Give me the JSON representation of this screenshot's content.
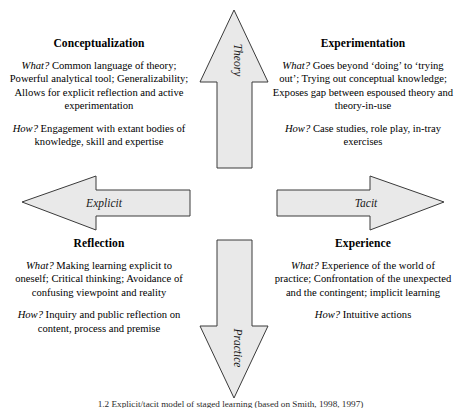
{
  "figure": {
    "caption": "1.2   Explicit/tacit model of staged learning (based on Smith, 1998, 1997)"
  },
  "axes": {
    "vertical_top": "Theory",
    "vertical_bottom": "Practice",
    "horizontal_left": "Explicit",
    "horizontal_right": "Tacit"
  },
  "labels": {
    "what": "What?",
    "how": "How?"
  },
  "quadrants": [
    {
      "id": "conceptualization",
      "title": "Conceptualization",
      "what": "Common language of theory; Powerful analytical tool; Generalizability; Allows for explicit reflection and active experimentation",
      "how": "Engagement with extant bodies of knowledge, skill and expertise"
    },
    {
      "id": "experimentation",
      "title": "Experimentation",
      "what": "Goes beyond ‘doing’ to ‘trying out’; Trying out conceptual knowledge; Exposes gap between espoused theory and theory-in-use",
      "how": "Case studies, role play, in-tray exercises"
    },
    {
      "id": "reflection",
      "title": "Reflection",
      "what": "Making learning explicit to oneself; Critical thinking; Avoidance of confusing viewpoint and reality",
      "how": "Inquiry and public reflection on content, process and premise"
    },
    {
      "id": "experience",
      "title": "Experience",
      "what": "Experience of the world of practice; Confrontation of the unexpected and the contingent; implicit learning",
      "how": "Intuitive actions"
    }
  ],
  "colors": {
    "arrow_fill": "#e9e9e9",
    "arrow_stroke": "#3a3a3a",
    "text": "#000000",
    "background": "#ffffff"
  }
}
